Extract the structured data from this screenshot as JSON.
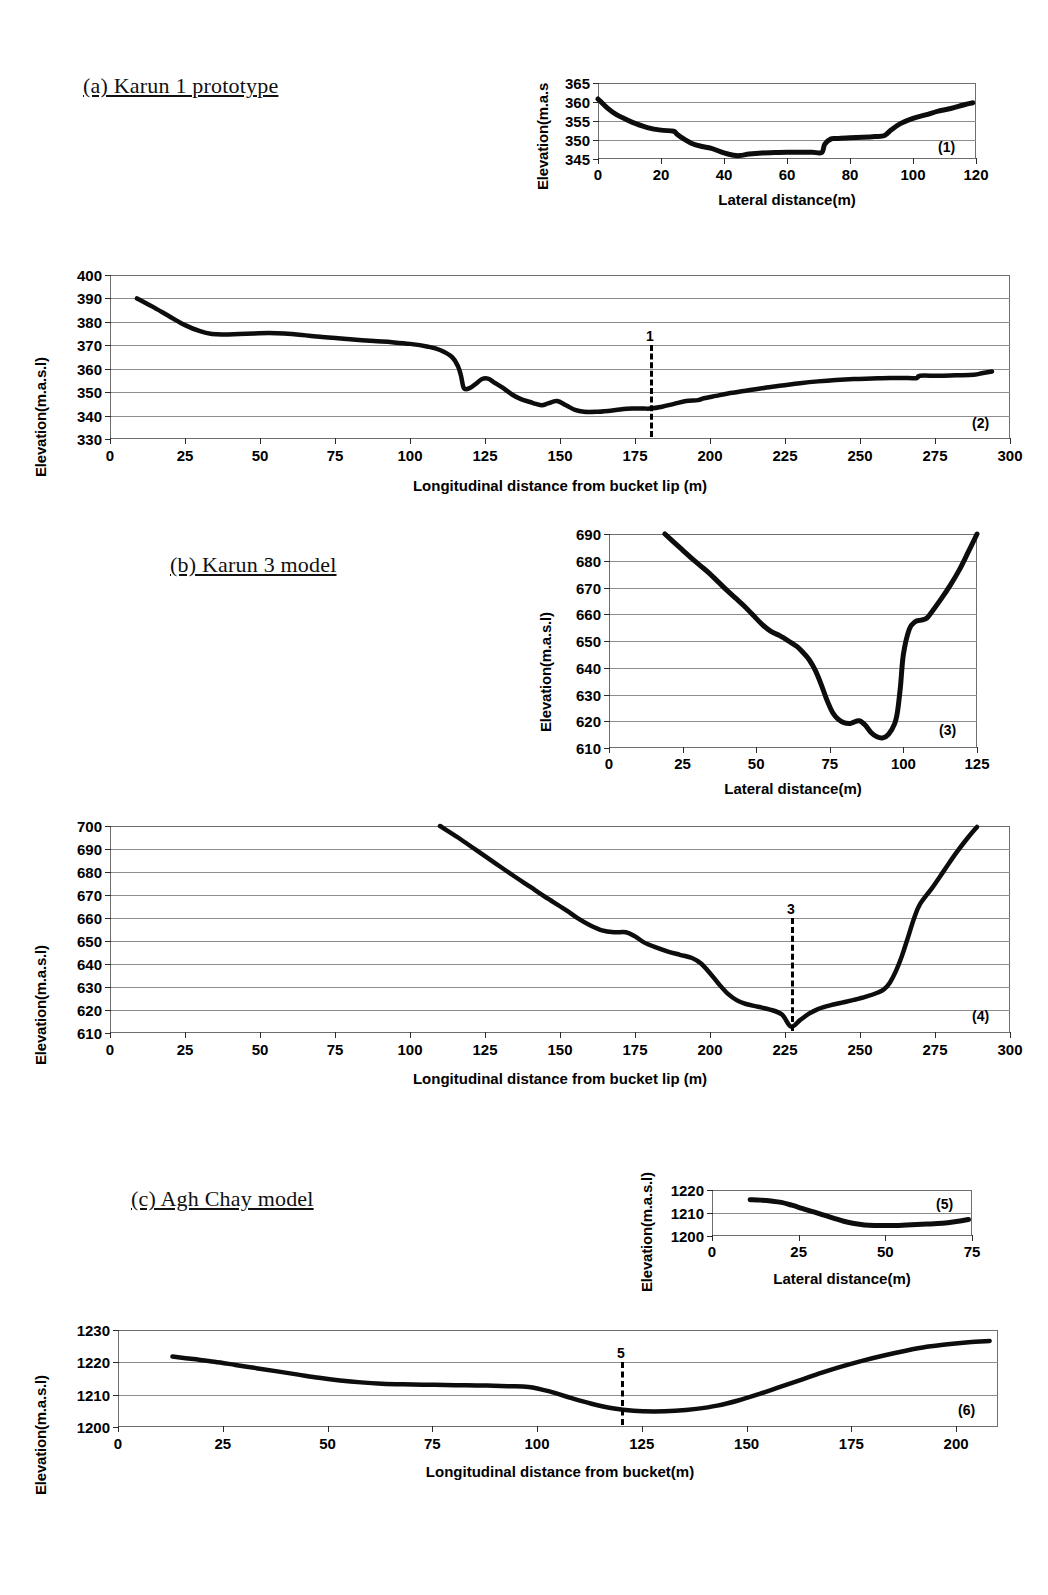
{
  "figure": {
    "sections": [
      {
        "id": "a",
        "label": "(a) Karun 1 prototype"
      },
      {
        "id": "b",
        "label": "(b) Karun 3 model"
      },
      {
        "id": "c",
        "label": "(c) Agh Chay model"
      }
    ]
  },
  "chart_data": [
    {
      "type": "line",
      "panel_id": "(1)",
      "title": "",
      "xlabel": "Lateral distance(m)",
      "ylabel": "Elevation(m.a.s",
      "xlim": [
        0,
        120
      ],
      "ylim": [
        345,
        365
      ],
      "xticks": [
        0,
        20,
        40,
        60,
        80,
        100,
        120
      ],
      "yticks": [
        345,
        350,
        355,
        360,
        365
      ],
      "grid": true,
      "legend": "none",
      "x": [
        0,
        3,
        6,
        9,
        12,
        16,
        20,
        24,
        25,
        27,
        30,
        33,
        36,
        40,
        43,
        45,
        48,
        52,
        56,
        60,
        64,
        68,
        71,
        72,
        74,
        76,
        80,
        84,
        88,
        91,
        93,
        96,
        100,
        104,
        108,
        112,
        116,
        119
      ],
      "y": [
        360.8,
        358.4,
        356.6,
        355.4,
        354.3,
        353.2,
        352.6,
        352.3,
        351.6,
        350.4,
        349.0,
        348.3,
        347.8,
        346.6,
        346.0,
        345.9,
        346.3,
        346.6,
        346.7,
        346.8,
        346.8,
        346.8,
        346.7,
        348.9,
        350.3,
        350.4,
        350.6,
        350.7,
        350.9,
        351.2,
        352.6,
        354.3,
        355.7,
        356.6,
        357.6,
        358.3,
        359.2,
        359.8
      ]
    },
    {
      "type": "line",
      "panel_id": "(2)",
      "title": "",
      "xlabel": "Longitudinal distance from bucket lip (m)",
      "ylabel": "Elevation(m.a.s.l)",
      "xlim": [
        0,
        300
      ],
      "ylim": [
        330,
        400
      ],
      "xticks": [
        0,
        25,
        50,
        75,
        100,
        125,
        150,
        175,
        200,
        225,
        250,
        275,
        300
      ],
      "yticks": [
        330,
        340,
        350,
        360,
        370,
        380,
        390,
        400
      ],
      "grid": true,
      "legend": "none",
      "marker": {
        "label": "1",
        "x": 180
      },
      "x": [
        9,
        14,
        20,
        25,
        30,
        34,
        38,
        43,
        48,
        53,
        58,
        64,
        70,
        76,
        82,
        88,
        94,
        100,
        106,
        110,
        114,
        116,
        117,
        118,
        120,
        122,
        124,
        126,
        128,
        131,
        134,
        137,
        140,
        142,
        144,
        146,
        149,
        152,
        155,
        158,
        162,
        166,
        170,
        174,
        178,
        180,
        184,
        188,
        192,
        196,
        198,
        202,
        206,
        212,
        218,
        224,
        230,
        236,
        242,
        248,
        254,
        260,
        266,
        269,
        270,
        276,
        282,
        288,
        291,
        294
      ],
      "y": [
        390.0,
        386.6,
        382.2,
        378.6,
        376.0,
        374.8,
        374.6,
        374.8,
        375.0,
        375.2,
        375.0,
        374.4,
        373.6,
        373.0,
        372.4,
        371.8,
        371.3,
        370.6,
        369.4,
        368.0,
        365.0,
        361.0,
        357.0,
        351.6,
        351.8,
        353.6,
        355.6,
        355.8,
        354.2,
        351.8,
        349.0,
        347.0,
        345.8,
        345.0,
        344.4,
        345.2,
        346.2,
        344.4,
        342.4,
        341.6,
        341.6,
        342.0,
        342.6,
        343.0,
        343.0,
        343.0,
        343.8,
        345.0,
        346.2,
        346.6,
        347.4,
        348.4,
        349.4,
        350.6,
        351.8,
        352.8,
        353.8,
        354.6,
        355.2,
        355.6,
        355.8,
        356.0,
        356.0,
        356.0,
        357.0,
        357.0,
        357.2,
        357.4,
        358.2,
        358.8
      ]
    },
    {
      "type": "line",
      "panel_id": "(3)",
      "title": "",
      "xlabel": "Lateral distance(m)",
      "ylabel": "Elevation(m.a.s.l)",
      "xlim": [
        0,
        125
      ],
      "ylim": [
        610,
        690
      ],
      "xticks": [
        0,
        25,
        50,
        75,
        100,
        125
      ],
      "yticks": [
        610,
        620,
        630,
        640,
        650,
        660,
        670,
        680,
        690
      ],
      "grid": true,
      "legend": "none",
      "x": [
        19,
        22,
        25,
        28,
        31,
        34,
        37,
        40,
        43,
        46,
        49,
        52,
        55,
        58,
        61,
        64,
        66,
        68,
        70,
        72,
        74,
        76,
        78,
        80,
        82,
        83,
        85,
        87,
        89,
        91,
        93,
        95,
        97,
        98,
        99,
        100,
        102,
        104,
        106,
        108,
        110,
        113,
        116,
        119,
        122,
        125
      ],
      "y": [
        690.0,
        687.0,
        684.0,
        681.0,
        678.2,
        675.4,
        672.2,
        669.0,
        666.0,
        663.0,
        659.6,
        656.2,
        653.6,
        652.0,
        650.0,
        647.8,
        645.6,
        643.0,
        639.2,
        634.0,
        628.0,
        623.2,
        620.6,
        619.4,
        619.2,
        619.6,
        620.2,
        618.6,
        615.8,
        614.2,
        613.8,
        615.2,
        619.0,
        623.6,
        633.0,
        645.0,
        654.4,
        657.2,
        657.8,
        658.6,
        661.4,
        666.0,
        671.0,
        676.6,
        683.2,
        690.0
      ]
    },
    {
      "type": "line",
      "panel_id": "(4)",
      "title": "",
      "xlabel": "Longitudinal distance from bucket lip (m)",
      "ylabel": "Elevation(m.a.s.l)",
      "xlim": [
        0,
        300
      ],
      "ylim": [
        610,
        700
      ],
      "xticks": [
        0,
        25,
        50,
        75,
        100,
        125,
        150,
        175,
        200,
        225,
        250,
        275,
        300
      ],
      "yticks": [
        610,
        620,
        630,
        640,
        650,
        660,
        670,
        680,
        690,
        700
      ],
      "grid": true,
      "legend": "none",
      "marker": {
        "label": "3",
        "x": 227
      },
      "x": [
        110,
        116,
        122,
        128,
        134,
        140,
        146,
        152,
        156,
        160,
        164,
        168,
        172,
        175,
        178,
        182,
        186,
        190,
        194,
        197,
        200,
        203,
        206,
        209,
        212,
        216,
        220,
        224,
        227,
        230,
        233,
        236,
        240,
        244,
        248,
        252,
        256,
        258,
        260,
        262,
        264,
        266,
        268,
        270,
        274,
        278,
        282,
        286,
        289
      ],
      "y": [
        700.0,
        695.0,
        689.6,
        684.2,
        678.8,
        673.6,
        668.4,
        663.4,
        659.8,
        656.8,
        654.6,
        653.8,
        653.8,
        652.0,
        649.4,
        647.2,
        645.4,
        644.0,
        642.6,
        640.2,
        636.0,
        631.2,
        627.0,
        624.2,
        622.6,
        621.4,
        620.2,
        618.0,
        612.8,
        615.6,
        618.4,
        620.4,
        622.0,
        623.2,
        624.4,
        625.8,
        627.6,
        629.0,
        632.0,
        637.0,
        643.6,
        651.6,
        659.8,
        666.0,
        673.0,
        680.6,
        688.2,
        695.0,
        699.6
      ]
    },
    {
      "type": "line",
      "panel_id": "(5)",
      "title": "",
      "xlabel": "Lateral distance(m)",
      "ylabel": "Elevation(m.a.s.l)",
      "xlim": [
        0,
        75
      ],
      "ylim": [
        1200,
        1220
      ],
      "xticks": [
        0,
        25,
        50,
        75
      ],
      "yticks": [
        1200,
        1210,
        1220
      ],
      "grid": true,
      "legend": "none",
      "x": [
        11,
        14,
        17,
        20,
        23,
        26,
        29,
        32,
        35,
        38,
        41,
        44,
        47,
        50,
        53,
        56,
        59,
        62,
        65,
        68,
        71,
        74
      ],
      "y": [
        1215.8,
        1215.6,
        1215.2,
        1214.6,
        1213.4,
        1212.0,
        1210.6,
        1209.2,
        1207.8,
        1206.4,
        1205.4,
        1204.8,
        1204.6,
        1204.6,
        1204.6,
        1204.8,
        1205.0,
        1205.2,
        1205.4,
        1205.8,
        1206.4,
        1207.2
      ]
    },
    {
      "type": "line",
      "panel_id": "(6)",
      "title": "",
      "xlabel": "Longitudinal distance from bucket(m)",
      "ylabel": "Elevation(m.a.s.l)",
      "xlim": [
        0,
        210
      ],
      "ylim": [
        1200,
        1230
      ],
      "xticks": [
        0,
        25,
        50,
        75,
        100,
        125,
        150,
        175,
        200
      ],
      "yticks": [
        1200,
        1210,
        1220,
        1230
      ],
      "grid": true,
      "legend": "none",
      "marker": {
        "label": "5",
        "x": 120
      },
      "x": [
        13,
        18,
        23,
        28,
        33,
        38,
        43,
        48,
        53,
        58,
        63,
        68,
        73,
        78,
        83,
        88,
        93,
        98,
        103,
        108,
        113,
        118,
        123,
        128,
        133,
        138,
        143,
        148,
        153,
        158,
        163,
        168,
        173,
        178,
        183,
        188,
        193,
        198,
        203,
        208
      ],
      "y": [
        1221.8,
        1221.0,
        1220.2,
        1219.2,
        1218.2,
        1217.2,
        1216.2,
        1215.2,
        1214.4,
        1213.8,
        1213.4,
        1213.2,
        1213.1,
        1213.0,
        1212.9,
        1212.8,
        1212.6,
        1212.4,
        1211.0,
        1209.0,
        1207.2,
        1205.8,
        1205.0,
        1204.8,
        1205.0,
        1205.6,
        1206.6,
        1208.2,
        1210.2,
        1212.4,
        1214.6,
        1216.8,
        1218.8,
        1220.6,
        1222.2,
        1223.6,
        1224.8,
        1225.6,
        1226.2,
        1226.6
      ]
    }
  ]
}
